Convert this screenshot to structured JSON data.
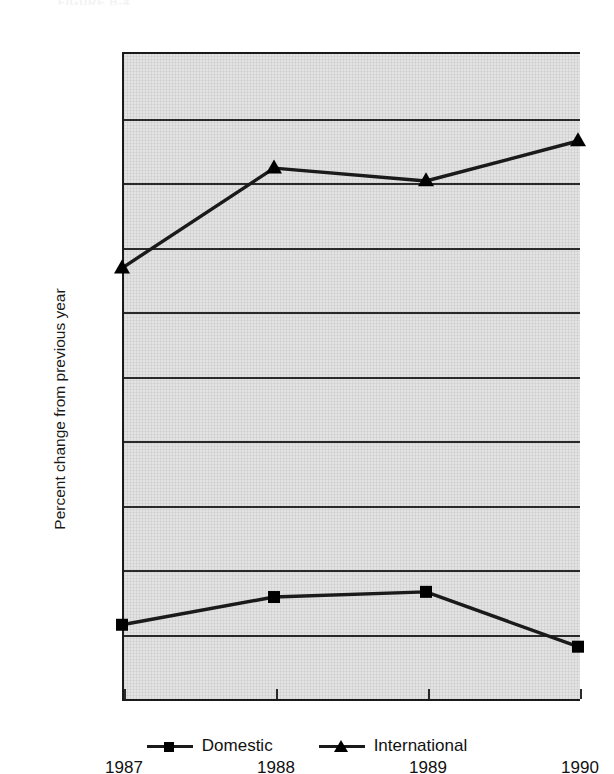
{
  "top_remnant_text": "FIGURE B-4",
  "chart_data": {
    "type": "line",
    "title": "",
    "xlabel": "",
    "ylabel": "Percent change from previous year",
    "categories": [
      "1987",
      "1988",
      "1989",
      "1990"
    ],
    "x": [
      1987,
      1988,
      1989,
      1990
    ],
    "ylim": [
      3.0,
      13.0
    ],
    "ytick_values": [
      3.0,
      4.0,
      5.0,
      6.0,
      7.0,
      8.0,
      9.0,
      10.0,
      11.0,
      12.0,
      13.0
    ],
    "ytick_labels": [
      "3.00%",
      "4.00%",
      "5.00%",
      "6.00%",
      "7.00%",
      "8.00%",
      "9.00%",
      "10.00%",
      "11.00%",
      "12.00%",
      "13.00%"
    ],
    "grid": true,
    "legend_position": "bottom",
    "series": [
      {
        "name": "Domestic",
        "marker": "square",
        "color": "#1a1a1a",
        "values": [
          4.12,
          4.55,
          4.63,
          3.78
        ]
      },
      {
        "name": "International",
        "marker": "triangle",
        "color": "#1a1a1a",
        "values": [
          9.65,
          11.2,
          11.0,
          11.62
        ]
      }
    ]
  },
  "legend": {
    "entries": [
      {
        "label": "Domestic",
        "marker_name": "legend-marker-square"
      },
      {
        "label": "International",
        "marker_name": "legend-marker-triangle"
      }
    ]
  }
}
